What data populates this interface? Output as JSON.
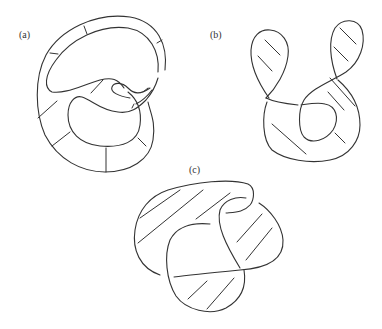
{
  "figure": {
    "type": "knot-surface-diagrams",
    "stroke_color": "#333333",
    "background": "#ffffff",
    "panels": [
      {
        "id": "a",
        "label": "(a)",
        "description": "Knot spanning surface with radial band stripes"
      },
      {
        "id": "b",
        "label": "(b)",
        "description": "Two-lobed knot surface with diagonal hatching"
      },
      {
        "id": "c",
        "label": "(c)",
        "description": "Three-lobed knot surface with diagonal hatching"
      }
    ]
  }
}
